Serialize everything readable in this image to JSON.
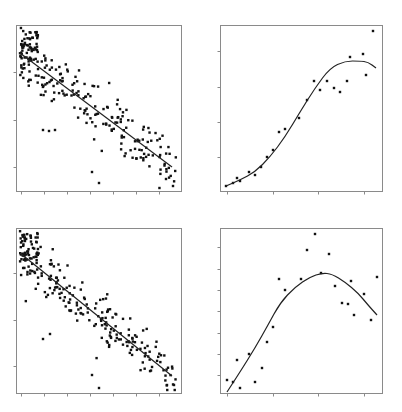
{
  "figure": {
    "layout": "2x2 grid of scatter plots with fitted curves, no titles, no axis labels, no tick labels",
    "colors": {
      "points": "#111111",
      "fit_line": "#222222",
      "frame": "#8a8a8a",
      "background": "#ffffff"
    }
  },
  "chart_data": [
    {
      "id": "top-left",
      "type": "scatter",
      "title": "",
      "xlabel": "",
      "ylabel": "",
      "fit": "linear",
      "description": "Dense cloud (~250 pts) with negative linear trend",
      "frame_px": [
        16,
        25,
        181,
        191
      ],
      "x_ticks_px": [
        21,
        44,
        67,
        90,
        113,
        136,
        159
      ],
      "y_ticks_px": [
        72,
        120,
        167
      ],
      "fit_line_px": [
        [
          20,
          53
        ],
        [
          172,
          167
        ]
      ],
      "n_points": 250,
      "seed": 7,
      "outliers_px": [
        [
          92,
          172
        ],
        [
          99,
          183
        ],
        [
          166,
          179
        ],
        [
          173,
          186
        ],
        [
          43,
          130
        ],
        [
          49,
          131
        ],
        [
          55,
          130
        ]
      ]
    },
    {
      "id": "top-right",
      "type": "scatter",
      "title": "",
      "xlabel": "",
      "ylabel": "",
      "fit": "smooth (logistic-like)",
      "description": "Sparse points following an S-shaped curve that plateaus",
      "frame_px": [
        220,
        25,
        382,
        191
      ],
      "x_ticks_px": [
        227,
        273,
        318,
        364
      ],
      "y_ticks_px": [
        51,
        87,
        122,
        157
      ],
      "points_px": [
        [
          226,
          186
        ],
        [
          233,
          183
        ],
        [
          237,
          178
        ],
        [
          240,
          181
        ],
        [
          249,
          172
        ],
        [
          255,
          175
        ],
        [
          261,
          167
        ],
        [
          267,
          157
        ],
        [
          273,
          150
        ],
        [
          279,
          132
        ],
        [
          285,
          129
        ],
        [
          299,
          118
        ],
        [
          307,
          100
        ],
        [
          314,
          81
        ],
        [
          320,
          90
        ],
        [
          327,
          81
        ],
        [
          334,
          88
        ],
        [
          340,
          92
        ],
        [
          347,
          81
        ],
        [
          350,
          57
        ],
        [
          363,
          54
        ],
        [
          366,
          75
        ],
        [
          373,
          31
        ]
      ],
      "fit_curve_px": [
        [
          226,
          186
        ],
        [
          240,
          180
        ],
        [
          255,
          172
        ],
        [
          270,
          157
        ],
        [
          285,
          137
        ],
        [
          300,
          112
        ],
        [
          315,
          88
        ],
        [
          330,
          68
        ],
        [
          345,
          61
        ],
        [
          360,
          61
        ],
        [
          368,
          62
        ],
        [
          376,
          68
        ]
      ]
    },
    {
      "id": "bottom-left",
      "type": "scatter",
      "title": "",
      "xlabel": "",
      "ylabel": "",
      "fit": "linear",
      "description": "Dense cloud (~250 pts) with negative linear trend",
      "frame_px": [
        16,
        228,
        181,
        393
      ],
      "x_ticks_px": [
        21,
        44,
        67,
        90,
        113,
        136,
        159
      ],
      "y_ticks_px": [
        273,
        320,
        366
      ],
      "fit_line_px": [
        [
          20,
          253
        ],
        [
          172,
          376
        ]
      ],
      "n_points": 250,
      "seed": 13,
      "outliers_px": [
        [
          92,
          375
        ],
        [
          99,
          388
        ],
        [
          167,
          385
        ],
        [
          174,
          385
        ],
        [
          43,
          339
        ],
        [
          50,
          334
        ]
      ]
    },
    {
      "id": "bottom-right",
      "type": "scatter",
      "title": "",
      "xlabel": "",
      "ylabel": "",
      "fit": "smooth (quadratic-like)",
      "description": "Sparse noisy points with a rising then falling hump-shaped fit",
      "frame_px": [
        220,
        228,
        382,
        393
      ],
      "x_ticks_px": [
        227,
        273,
        318,
        364
      ],
      "y_ticks_px": [
        247,
        269,
        290,
        311,
        333,
        354,
        375
      ],
      "points_px": [
        [
          227,
          380
        ],
        [
          233,
          382
        ],
        [
          237,
          360
        ],
        [
          240,
          388
        ],
        [
          249,
          354
        ],
        [
          255,
          382
        ],
        [
          262,
          368
        ],
        [
          267,
          342
        ],
        [
          273,
          327
        ],
        [
          279,
          279
        ],
        [
          285,
          290
        ],
        [
          301,
          279
        ],
        [
          307,
          250
        ],
        [
          315,
          234
        ],
        [
          321,
          273
        ],
        [
          329,
          254
        ],
        [
          335,
          286
        ],
        [
          342,
          303
        ],
        [
          348,
          304
        ],
        [
          351,
          281
        ],
        [
          354,
          315
        ],
        [
          364,
          294
        ],
        [
          371,
          320
        ],
        [
          377,
          277
        ]
      ],
      "fit_curve_px": [
        [
          227,
          392
        ],
        [
          240,
          372
        ],
        [
          255,
          348
        ],
        [
          268,
          325
        ],
        [
          280,
          303
        ],
        [
          295,
          287
        ],
        [
          310,
          277
        ],
        [
          322,
          273
        ],
        [
          332,
          274
        ],
        [
          345,
          282
        ],
        [
          358,
          293
        ],
        [
          368,
          305
        ],
        [
          377,
          315
        ]
      ]
    }
  ]
}
